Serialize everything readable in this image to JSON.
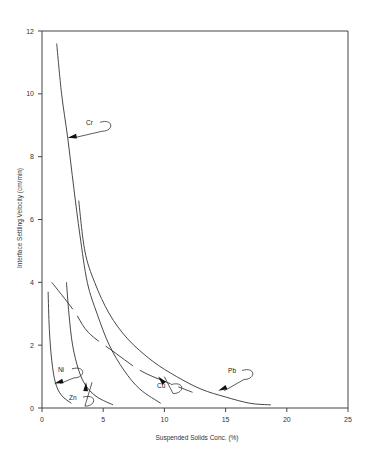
{
  "chart_data": {
    "type": "line",
    "title": "",
    "xlabel": "Suspended Solids Conc. (%)",
    "ylabel": "Interface Settling Velocity (cm/min)",
    "xlim": [
      0,
      25
    ],
    "ylim": [
      0,
      12
    ],
    "xticks": [
      0,
      5,
      10,
      15,
      20,
      25
    ],
    "yticks": [
      0,
      2,
      4,
      6,
      8,
      10,
      12
    ],
    "grid": false,
    "legend": "inline labels with arrows",
    "series": [
      {
        "name": "Cr",
        "style": "solid",
        "points": [
          [
            1.2,
            11.6
          ],
          [
            1.6,
            10.0
          ],
          [
            2.1,
            8.6
          ],
          [
            2.6,
            7.0
          ],
          [
            3.1,
            5.5
          ],
          [
            3.7,
            4.0
          ],
          [
            4.5,
            3.0
          ],
          [
            5.5,
            2.0
          ],
          [
            6.7,
            1.2
          ],
          [
            8.0,
            0.6
          ],
          [
            9.7,
            0.15
          ]
        ],
        "label_pos": [
          3.6,
          9.0
        ],
        "arrow_to": [
          2.1,
          8.6
        ]
      },
      {
        "name": "Pb",
        "style": "solid",
        "points": [
          [
            3.0,
            6.6
          ],
          [
            3.5,
            5.0
          ],
          [
            4.3,
            4.0
          ],
          [
            5.5,
            3.0
          ],
          [
            7.0,
            2.2
          ],
          [
            9.0,
            1.5
          ],
          [
            11.0,
            1.0
          ],
          [
            13.0,
            0.6
          ],
          [
            15.0,
            0.35
          ],
          [
            17.0,
            0.15
          ],
          [
            18.7,
            0.1
          ]
        ],
        "label_pos": [
          15.2,
          1.1
        ],
        "arrow_to": [
          14.4,
          0.55
        ]
      },
      {
        "name": "Cu",
        "style": "dashed",
        "points": [
          [
            0.8,
            4.0
          ],
          [
            2.6,
            3.1
          ],
          [
            3.8,
            2.4
          ],
          [
            6.0,
            1.75
          ],
          [
            8.0,
            1.2
          ],
          [
            10.0,
            0.85
          ],
          [
            12.3,
            0.5
          ]
        ],
        "label_pos": [
          9.4,
          0.65
        ],
        "arrow_to": [
          9.5,
          1.0
        ]
      },
      {
        "name": "Zn",
        "style": "solid",
        "points": [
          [
            2.0,
            4.0
          ],
          [
            2.2,
            3.0
          ],
          [
            2.5,
            2.0
          ],
          [
            3.0,
            1.2
          ],
          [
            3.6,
            0.7
          ],
          [
            4.5,
            0.35
          ],
          [
            5.8,
            0.1
          ]
        ],
        "label_pos": [
          2.2,
          0.25
        ],
        "arrow_to": [
          3.6,
          0.82
        ]
      },
      {
        "name": "Ni",
        "style": "solid",
        "points": [
          [
            0.5,
            3.7
          ],
          [
            0.6,
            2.5
          ],
          [
            0.8,
            1.5
          ],
          [
            1.1,
            0.8
          ],
          [
            1.6,
            0.4
          ],
          [
            2.4,
            0.15
          ]
        ],
        "label_pos": [
          1.3,
          1.15
        ],
        "arrow_to": [
          1.0,
          0.78
        ]
      }
    ]
  }
}
